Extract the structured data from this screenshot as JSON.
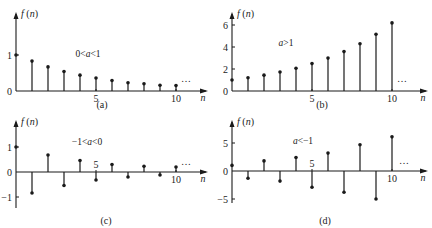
{
  "chart_data": [
    {
      "type": "stem",
      "panel": "a",
      "caption": "(a)",
      "ylabel": "f(n)",
      "xlabel": "n",
      "annotation": "0<a<1",
      "ellipsis": "...",
      "x": [
        0,
        1,
        2,
        3,
        4,
        5,
        6,
        7,
        8,
        9,
        10
      ],
      "values": [
        1.0,
        0.83,
        0.67,
        0.54,
        0.44,
        0.36,
        0.29,
        0.23,
        0.2,
        0.16,
        0.15
      ],
      "xticks": [
        5,
        10
      ],
      "yticks": [
        {
          "value": 0,
          "label": "0"
        },
        {
          "value": 1,
          "label": "1"
        }
      ],
      "xlim": [
        0,
        12
      ],
      "ylim": [
        0,
        1.45
      ]
    },
    {
      "type": "stem",
      "panel": "b",
      "caption": "(b)",
      "ylabel": "f(n)",
      "xlabel": "n",
      "annotation": "a>1",
      "ellipsis": "...",
      "x": [
        0,
        1,
        2,
        3,
        4,
        5,
        6,
        7,
        8,
        9,
        10
      ],
      "values": [
        1.0,
        1.2,
        1.44,
        1.73,
        2.07,
        2.49,
        2.99,
        3.58,
        4.3,
        5.16,
        6.19
      ],
      "xticks": [
        5,
        10
      ],
      "yticks": [
        {
          "value": 0,
          "label": "0"
        },
        {
          "value": 2,
          "label": "2"
        },
        {
          "value": 4,
          "label": "4"
        },
        {
          "value": 6,
          "label": "6"
        }
      ],
      "xlim": [
        0,
        12
      ],
      "ylim": [
        0,
        7
      ]
    },
    {
      "type": "stem",
      "panel": "c",
      "caption": "(c)",
      "ylabel": "f(n)",
      "xlabel": "n",
      "annotation": "-1<a<0",
      "ellipsis": "...",
      "x": [
        0,
        1,
        2,
        3,
        4,
        5,
        6,
        7,
        8,
        9,
        10
      ],
      "values": [
        1.0,
        -0.84,
        0.68,
        -0.54,
        0.46,
        -0.32,
        0.3,
        -0.2,
        0.23,
        -0.12,
        0.2
      ],
      "xticks": [
        5,
        10
      ],
      "yticks": [
        {
          "value": -1,
          "label": "-1"
        },
        {
          "value": 0,
          "label": "0"
        },
        {
          "value": 1,
          "label": "1"
        }
      ],
      "xlim": [
        0,
        12
      ],
      "ylim": [
        -1.4,
        1.8
      ]
    },
    {
      "type": "stem",
      "panel": "d",
      "caption": "(d)",
      "ylabel": "f(n)",
      "xlabel": "n",
      "annotation": "a<-1",
      "ellipsis": "...",
      "x": [
        0,
        1,
        2,
        3,
        4,
        5,
        6,
        7,
        8,
        9,
        10
      ],
      "values": [
        1.0,
        -1.3,
        1.8,
        -1.8,
        2.4,
        -2.9,
        3.2,
        -3.8,
        4.7,
        -5.0,
        6.1
      ],
      "xticks": [
        5,
        10
      ],
      "yticks": [
        {
          "value": -5,
          "label": "-5"
        },
        {
          "value": 0,
          "label": "0"
        },
        {
          "value": 5,
          "label": "5"
        }
      ],
      "xlim": [
        0,
        12
      ],
      "ylim": [
        -6,
        8.5
      ]
    }
  ]
}
